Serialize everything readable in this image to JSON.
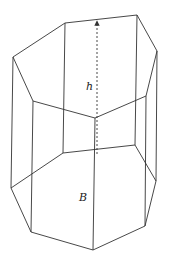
{
  "figure": {
    "labels": {
      "height": "h",
      "base": "B"
    },
    "colors": {
      "stroke": "#333333",
      "background": "#ffffff",
      "text": "#222222"
    },
    "top_face": [
      [
        13,
        57
      ],
      [
        65,
        23
      ],
      [
        137,
        15
      ],
      [
        157,
        51
      ],
      [
        146,
        96
      ],
      [
        95,
        118
      ],
      [
        33,
        101
      ]
    ],
    "bottom_face": [
      [
        11,
        188
      ],
      [
        63,
        153
      ],
      [
        135,
        145
      ],
      [
        156,
        181
      ],
      [
        145,
        226
      ],
      [
        93,
        250
      ],
      [
        31,
        232
      ]
    ],
    "height_segment": {
      "from": [
        97,
        154
      ],
      "to": [
        97,
        21
      ],
      "style": "dashed",
      "arrow": "up"
    },
    "label_positions": {
      "h": [
        86,
        90
      ],
      "B": [
        79,
        201
      ]
    }
  }
}
